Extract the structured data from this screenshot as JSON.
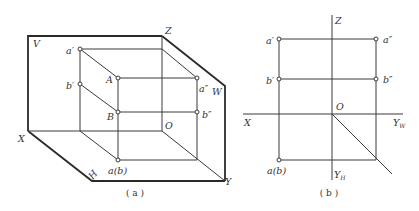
{
  "figure_a": {
    "caption": "( a )",
    "labels": {
      "V": "V",
      "Z": "Z",
      "W": "W",
      "X": "X",
      "Y": "Y",
      "H": "H",
      "O": "O",
      "A": "A",
      "B": "B",
      "a_prime": "a′",
      "b_prime": "b′",
      "a_dprime": "a″",
      "b_dprime": "b″",
      "a_b": "a(b)"
    }
  },
  "figure_b": {
    "caption": "( b )",
    "labels": {
      "Z": "Z",
      "X": "X",
      "O": "O",
      "Y_W": "Y",
      "Y_W_sub": "W",
      "Y_H": "Y",
      "Y_H_sub": "H",
      "a_prime": "a′",
      "b_prime": "b′",
      "a_dprime": "a″",
      "b_dprime": "b″",
      "a_b": "a(b)"
    }
  }
}
